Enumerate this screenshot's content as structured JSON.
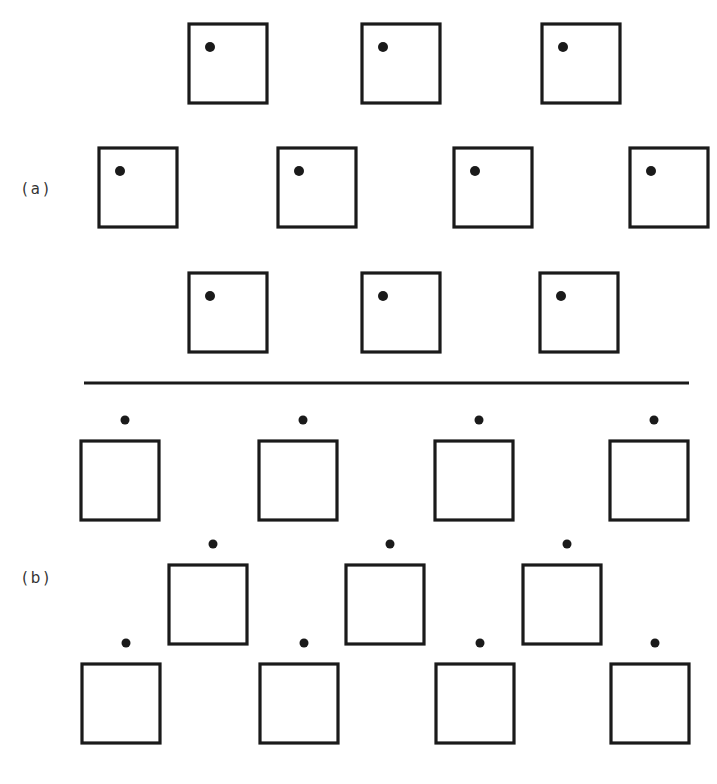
{
  "figure": {
    "panels": [
      {
        "label": "(a)",
        "description": "Square lattice cells with a dot located inside each box (upper-left interior)",
        "dot_position": "inside",
        "rows": [
          {
            "count": 3
          },
          {
            "count": 4
          },
          {
            "count": 3
          }
        ]
      },
      {
        "label": "(b)",
        "description": "Square lattice cells with a dot located above each box (outside, centered-right)",
        "dot_position": "above",
        "rows": [
          {
            "count": 4
          },
          {
            "count": 3
          },
          {
            "count": 4
          }
        ]
      }
    ],
    "divider": true,
    "ink_color": "#1a1a1a"
  }
}
